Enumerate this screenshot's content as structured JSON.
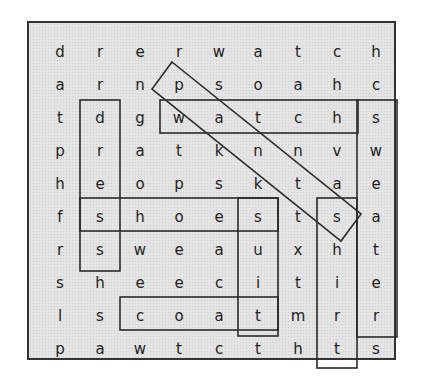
{
  "puzzle": {
    "type": "word-search",
    "rows": 10,
    "cols": 9,
    "grid": [
      [
        "d",
        "r",
        "e",
        "r",
        "w",
        "a",
        "t",
        "c",
        "h"
      ],
      [
        "a",
        "r",
        "n",
        "p",
        "s",
        "o",
        "a",
        "h",
        "c"
      ],
      [
        "t",
        "d",
        "g",
        "w",
        "a",
        "t",
        "c",
        "h",
        "s"
      ],
      [
        "p",
        "r",
        "a",
        "t",
        "k",
        "n",
        "n",
        "v",
        "w"
      ],
      [
        "h",
        "e",
        "o",
        "p",
        "s",
        "k",
        "t",
        "a",
        "e"
      ],
      [
        "f",
        "s",
        "h",
        "o",
        "e",
        "s",
        "t",
        "s",
        "a"
      ],
      [
        "r",
        "s",
        "w",
        "e",
        "a",
        "u",
        "x",
        "h",
        "t"
      ],
      [
        "s",
        "h",
        "e",
        "e",
        "c",
        "i",
        "t",
        "i",
        "e"
      ],
      [
        "l",
        "s",
        "c",
        "o",
        "a",
        "t",
        "m",
        "r",
        "r"
      ],
      [
        "p",
        "a",
        "w",
        "t",
        "c",
        "t",
        "h",
        "t",
        "s"
      ]
    ],
    "found_words": [
      {
        "word": "dress",
        "start": [
          2,
          1
        ],
        "end": [
          6,
          1
        ],
        "direction": "down"
      },
      {
        "word": "watch",
        "start": [
          2,
          3
        ],
        "end": [
          2,
          7
        ],
        "direction": "right"
      },
      {
        "word": "sweater",
        "start": [
          2,
          8
        ],
        "end": [
          8,
          8
        ],
        "direction": "down"
      },
      {
        "word": "shoes",
        "start": [
          5,
          1
        ],
        "end": [
          5,
          5
        ],
        "direction": "right"
      },
      {
        "word": "suit",
        "start": [
          5,
          5
        ],
        "end": [
          8,
          5
        ],
        "direction": "down"
      },
      {
        "word": "coat",
        "start": [
          8,
          2
        ],
        "end": [
          8,
          5
        ],
        "direction": "right"
      },
      {
        "word": "shirt",
        "start": [
          5,
          7
        ],
        "end": [
          9,
          7
        ],
        "direction": "down"
      },
      {
        "word": "pants",
        "start": [
          1,
          3
        ],
        "end": [
          5,
          7
        ],
        "direction": "diagonal-down-right"
      }
    ],
    "colors": {
      "background": "#e4e4e4",
      "border": "#333333",
      "text": "#222222"
    }
  }
}
